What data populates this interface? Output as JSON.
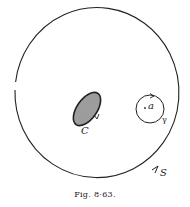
{
  "figure": {
    "caption": "Fig. 8·63.",
    "labels": {
      "outer_contour": "S",
      "region": "C",
      "point": "a",
      "small_contour": "γ"
    }
  },
  "colors": {
    "ink": "#222222",
    "background": "#ffffff"
  }
}
